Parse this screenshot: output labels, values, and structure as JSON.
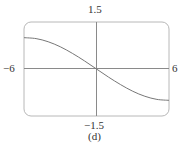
{
  "chart_data": {
    "type": "line",
    "title": "",
    "caption": "(d)",
    "xlabel": "",
    "ylabel": "",
    "xlim": [
      -6,
      6
    ],
    "ylim": [
      -1.5,
      1.5
    ],
    "tick_labels": {
      "x_min": "−6",
      "x_max": "6",
      "y_max": "1.5",
      "y_min": "−1.5"
    },
    "grid": false,
    "legend": null,
    "series": [
      {
        "name": "f(x)",
        "x": [
          -6,
          -5,
          -4,
          -3,
          -2,
          -1,
          0,
          1,
          2,
          3,
          4,
          5,
          6
        ],
        "values": [
          1.0,
          0.97,
          0.87,
          0.71,
          0.5,
          0.26,
          0.0,
          -0.26,
          -0.5,
          -0.71,
          -0.87,
          -0.97,
          -1.0
        ]
      }
    ]
  },
  "labels": {
    "y_max": "1.5",
    "y_min": "−1.5",
    "x_min": "−6",
    "x_max": "6",
    "caption": "(d)"
  },
  "colors": {
    "frame": "#b0b0b0",
    "axis": "#8a8a8a",
    "curve": "#777777"
  }
}
